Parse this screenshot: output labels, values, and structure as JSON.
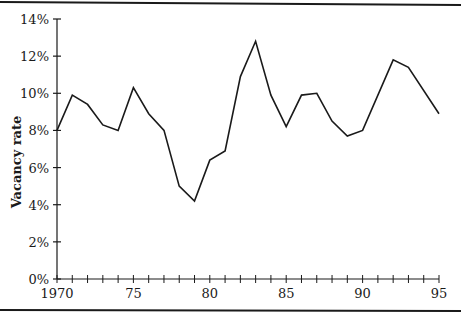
{
  "chart_data": {
    "type": "line",
    "title": "",
    "xlabel": "",
    "ylabel": "Vacancy rate",
    "x": [
      1970,
      1971,
      1972,
      1973,
      1974,
      1975,
      1976,
      1977,
      1978,
      1979,
      1980,
      1981,
      1982,
      1983,
      1984,
      1985,
      1986,
      1987,
      1988,
      1989,
      1990,
      1992,
      1993,
      1995
    ],
    "series": [
      {
        "name": "Vacancy rate",
        "values": [
          8.0,
          9.9,
          9.4,
          8.3,
          8.0,
          10.3,
          8.9,
          8.0,
          5.0,
          4.2,
          6.4,
          6.9,
          10.9,
          12.8,
          9.9,
          8.2,
          9.9,
          10.0,
          8.5,
          7.7,
          8.0,
          11.8,
          11.4,
          8.9
        ]
      }
    ],
    "xlim": [
      1970,
      1995
    ],
    "ylim": [
      0,
      14
    ],
    "x_tick_labels": [
      "1970",
      "75",
      "80",
      "85",
      "90",
      "95"
    ],
    "x_tick_values": [
      1970,
      1975,
      1980,
      1985,
      1990,
      1995
    ],
    "x_minor_ticks_every": 1,
    "y_tick_labels": [
      "0%",
      "2%",
      "4%",
      "6%",
      "8%",
      "10%",
      "12%",
      "14%"
    ],
    "y_tick_values": [
      0,
      2,
      4,
      6,
      8,
      10,
      12,
      14
    ],
    "grid": false,
    "legend": null,
    "colors": {
      "line": "#1a1a1a",
      "axis": "#1a1a1a",
      "border": "#1a1a1a"
    }
  }
}
